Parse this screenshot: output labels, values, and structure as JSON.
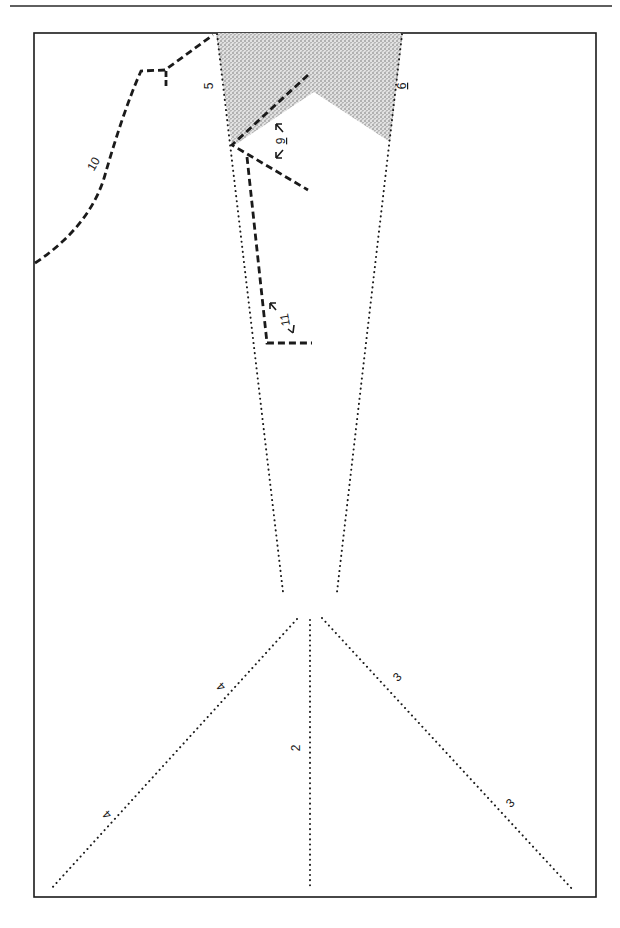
{
  "figure": {
    "type": "sewing-pattern-diagram",
    "colors": {
      "ink": "#1a1a1a",
      "shade": "#9a9a9a",
      "background": "#ffffff"
    }
  },
  "labels": {
    "line_2": "2",
    "line_3_upper": "3",
    "line_3_lower": "3",
    "line_4_upper": "4",
    "line_4_lower": "4",
    "line_5": "5",
    "line_6": "6",
    "line_9": "9",
    "line_10": "10",
    "line_11": "11"
  },
  "legend": {
    "dotted": "construction line",
    "dashed": "cutting line",
    "stippled": "shaded (removed) area"
  }
}
